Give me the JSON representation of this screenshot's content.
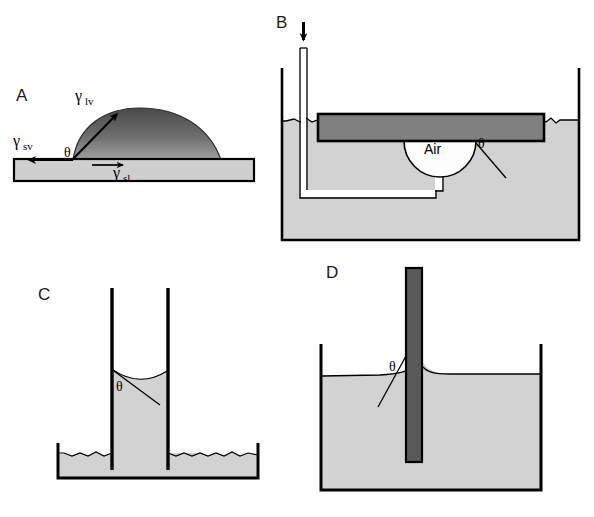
{
  "figure": {
    "background_color": "#ffffff",
    "width": 594,
    "height": 517
  },
  "colors": {
    "liquid_fill": "#d2d2d2",
    "substrate_fill": "#cfcfcf",
    "plate_fill": "#808080",
    "droplet_top": "#4a4a4a",
    "droplet_bottom": "#9a9a9a",
    "bubble_fill": "#fdfdfd",
    "outline": "#000000",
    "label_color": "#1a1a1a"
  },
  "panels": [
    {
      "id": "A",
      "letter": "A",
      "name": "sessile-drop",
      "labels": {
        "gamma_lv": "γ",
        "gamma_lv_sub": "lv",
        "gamma_sv": "γ",
        "gamma_sv_sub": "sv",
        "gamma_sl": "γ",
        "gamma_sl_sub": "sl",
        "theta": "θ"
      }
    },
    {
      "id": "B",
      "letter": "B",
      "name": "captive-bubble",
      "labels": {
        "air": "Air",
        "theta": "θ"
      }
    },
    {
      "id": "C",
      "letter": "C",
      "name": "capillary-rise",
      "labels": {
        "theta": "θ"
      }
    },
    {
      "id": "D",
      "letter": "D",
      "name": "wilhelmy-plate",
      "labels": {
        "theta": "θ"
      }
    }
  ]
}
